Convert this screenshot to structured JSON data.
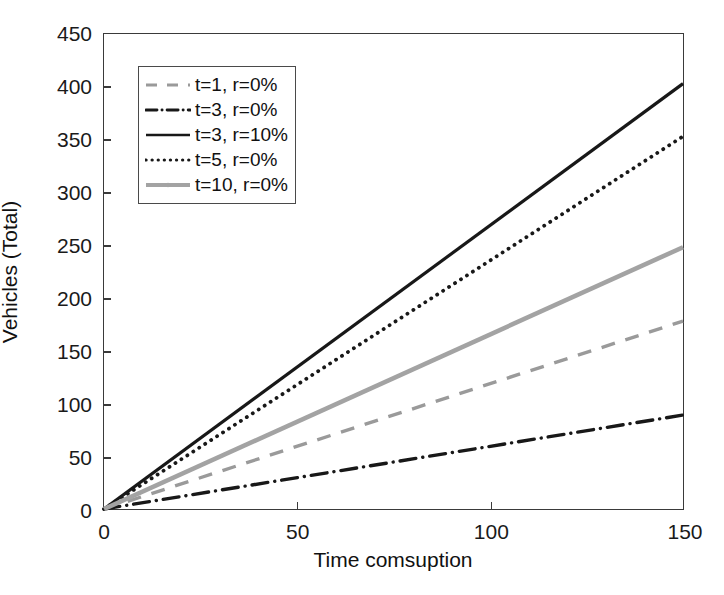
{
  "chart_data": {
    "type": "line",
    "title": "",
    "xlabel": "Time comsuption",
    "ylabel": "Vehicles (Total)",
    "xlim": [
      0,
      150
    ],
    "ylim": [
      0,
      450
    ],
    "xticks": [
      0,
      50,
      100,
      150
    ],
    "yticks": [
      0,
      50,
      100,
      150,
      200,
      250,
      300,
      350,
      400,
      450
    ],
    "xtick_labels": [
      "0",
      "50",
      "100",
      "150"
    ],
    "ytick_labels": [
      "0",
      "50",
      "100",
      "150",
      "200",
      "250",
      "300",
      "350",
      "400",
      "450"
    ],
    "grid": false,
    "legend_position": "upper left",
    "x": [
      0,
      150
    ],
    "series": [
      {
        "name": "t=1, r=0%",
        "style": "dashed",
        "color": "#9a9a9a",
        "width": 3.4,
        "marker": "none",
        "values": [
          0,
          178
        ],
        "slope": 1.187
      },
      {
        "name": "t=3, r=0%",
        "style": "dashdot",
        "color": "#181818",
        "width": 3.4,
        "marker": "none",
        "values": [
          0,
          89
        ],
        "slope": 0.593
      },
      {
        "name": "t=3, r=10%",
        "style": "solid",
        "color": "#181818",
        "width": 3.2,
        "marker": "none",
        "values": [
          0,
          403
        ],
        "slope": 2.687
      },
      {
        "name": "t=5, r=0%",
        "style": "dotted",
        "color": "#181818",
        "width": 3.8,
        "marker": "none",
        "values": [
          0,
          353
        ],
        "slope": 2.353
      },
      {
        "name": "t=10, r=0%",
        "style": "solid",
        "color": "#a3a3a3",
        "width": 4.6,
        "marker": "dot",
        "values": [
          0,
          248
        ],
        "slope": 1.653
      }
    ]
  },
  "axes": {
    "frame_color": "#3a3a3a",
    "background": "#ffffff"
  },
  "legend": {
    "entries": [
      {
        "label": "t=1, r=0%"
      },
      {
        "label": "t=3, r=0%"
      },
      {
        "label": "t=3, r=10%"
      },
      {
        "label": "t=5, r=0%"
      },
      {
        "label": "t=10, r=0%"
      }
    ]
  }
}
